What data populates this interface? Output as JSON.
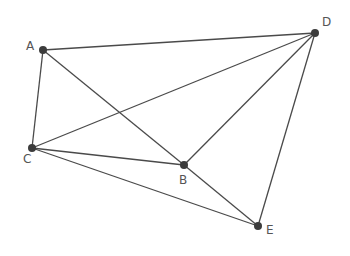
{
  "diagram": {
    "points": [
      {
        "id": "A",
        "label": "A",
        "x": 43,
        "y": 50,
        "lx": 26,
        "ly": 50
      },
      {
        "id": "D",
        "label": "D",
        "x": 315,
        "y": 33,
        "lx": 322,
        "ly": 26
      },
      {
        "id": "C",
        "label": "C",
        "x": 32,
        "y": 148,
        "lx": 23,
        "ly": 163
      },
      {
        "id": "B",
        "label": "B",
        "x": 184,
        "y": 165,
        "lx": 179,
        "ly": 184
      },
      {
        "id": "E",
        "label": "E",
        "x": 258,
        "y": 226,
        "lx": 266,
        "ly": 234
      }
    ],
    "edges": [
      [
        "A",
        "D"
      ],
      [
        "A",
        "C"
      ],
      [
        "A",
        "B"
      ],
      [
        "C",
        "D"
      ],
      [
        "C",
        "B"
      ],
      [
        "C",
        "E"
      ],
      [
        "B",
        "D"
      ],
      [
        "B",
        "E"
      ],
      [
        "D",
        "E"
      ]
    ],
    "colors": {
      "line": "#4a4a4a",
      "point": "#3c3c3c",
      "label": "#555555"
    }
  }
}
